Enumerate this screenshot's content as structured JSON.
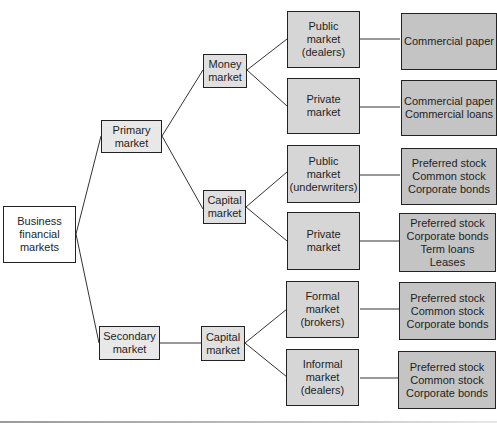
{
  "diagram": {
    "type": "tree",
    "root": "Business\nfinancial\nmarkets",
    "level2": {
      "primary": "Primary\nmarket",
      "secondary": "Secondary\nmarket"
    },
    "level3": {
      "money_market": "Money\nmarket",
      "capital_market_primary": "Capital\nmarket",
      "capital_market_secondary": "Capital\nmarket"
    },
    "level4": [
      "Public\nmarket\n(dealers)",
      "Private\nmarket",
      "Public\nmarket\n(underwriters)",
      "Private\nmarket",
      "Formal\nmarket\n(brokers)",
      "Informal\nmarket\n(dealers)"
    ],
    "level5": [
      "Commercial paper",
      "Commercial paper\nCommercial loans",
      "Preferred stock\nCommon stock\nCorporate bonds",
      "Preferred stock\nCorporate bonds\nTerm loans\nLeases",
      "Preferred stock\nCommon stock\nCorporate bonds",
      "Preferred stock\nCommon stock\nCorporate bonds"
    ],
    "colors": {
      "root_fill": "#ffffff",
      "level2_fill": "#e8e8e8",
      "level3_fill": "#e0e0e0",
      "level4_fill": "#d6d6d6",
      "level5_fill": "#c4c4c4",
      "border": "#222222",
      "connector": "#333333"
    }
  }
}
